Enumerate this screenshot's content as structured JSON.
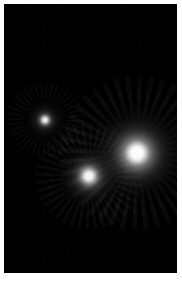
{
  "viewer": {
    "canvas_width": 182,
    "canvas_height": 284,
    "background_color": "#ffffff",
    "frame": {
      "left": 4,
      "top": 4,
      "width": 173,
      "height": 269,
      "background_color": "#000000",
      "border_color": "#ffffff"
    }
  },
  "chart_data": {
    "type": "scatter",
    "title": "",
    "subtitle": "",
    "xlabel": "",
    "ylabel": "",
    "xlim": [
      0,
      173
    ],
    "ylim": [
      0,
      269
    ],
    "grid": false,
    "legend": "none",
    "background_color": "#000000",
    "colormap": "grayscale",
    "sources": [
      {
        "id": "source-1",
        "label": "top-left source",
        "cx": 41,
        "cy": 116,
        "core_radius": 4,
        "halo_radius": 19,
        "peak_color": "#ffffff",
        "peak_brightness": 0.86,
        "halo_color": "#9a9a9a",
        "relative_flux": 0.35
      },
      {
        "id": "source-2",
        "label": "middle source",
        "cx": 85,
        "cy": 172,
        "core_radius": 7,
        "halo_radius": 27,
        "peak_color": "#ffffff",
        "peak_brightness": 0.95,
        "halo_color": "#b4b4b4",
        "relative_flux": 0.62
      },
      {
        "id": "source-3",
        "label": "bright right source",
        "cx": 133,
        "cy": 149,
        "core_radius": 10,
        "halo_radius": 39,
        "peak_color": "#ffffff",
        "peak_brightness": 1.0,
        "halo_color": "#c8c8c8",
        "relative_flux": 1.0
      }
    ]
  }
}
